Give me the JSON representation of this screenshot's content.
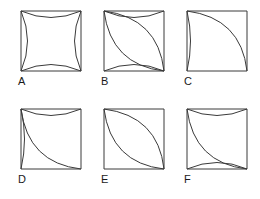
{
  "sheet": {
    "title": "Six square-with-arc geometric figures",
    "background_color": "#ffffff",
    "stroke_color": "#3a3a3a",
    "label_color": "#1a1a1a",
    "width": 260,
    "height": 199,
    "columns": 3,
    "rows": 2
  },
  "figures": [
    {
      "id": "A",
      "label": "A",
      "description": "Square with all four sides replaced by arcs curving inward (concave square / astroid)",
      "x": 20,
      "y": 10,
      "size": 62,
      "label_x": 18,
      "label_y": 80,
      "arcs": [
        {
          "name": "top-inward-arc",
          "from": "top-left",
          "to": "top-right",
          "bulge": "inward"
        },
        {
          "name": "right-inward-arc",
          "from": "top-right",
          "to": "bottom-right",
          "bulge": "inward"
        },
        {
          "name": "bottom-inward-arc",
          "from": "bottom-left",
          "to": "bottom-right",
          "bulge": "inward"
        },
        {
          "name": "left-inward-arc",
          "from": "top-left",
          "to": "bottom-left",
          "bulge": "inward"
        }
      ]
    },
    {
      "id": "B",
      "label": "B",
      "description": "Square with top and bottom arcs curving inward, plus a lens (two arcs) spanning the top-left to bottom-right diagonal",
      "x": 103,
      "y": 10,
      "size": 62,
      "label_x": 101,
      "label_y": 80,
      "arcs": [
        {
          "name": "top-inward-arc",
          "from": "top-left",
          "to": "top-right",
          "bulge": "inward"
        },
        {
          "name": "bottom-inward-arc",
          "from": "bottom-left",
          "to": "bottom-right",
          "bulge": "inward"
        },
        {
          "name": "diagonal-arc-upper",
          "from": "top-left",
          "to": "bottom-right",
          "bulge": "toward-top-right"
        },
        {
          "name": "diagonal-arc-lower",
          "from": "top-left",
          "to": "bottom-right",
          "bulge": "toward-bottom-left"
        }
      ]
    },
    {
      "id": "C",
      "label": "C",
      "description": "Square with left side arc bulging outward slightly and one quarter-circle arc from top-left to bottom-right",
      "x": 186,
      "y": 10,
      "size": 62,
      "label_x": 184,
      "label_y": 80,
      "arcs": [
        {
          "name": "left-outward-arc",
          "from": "top-left",
          "to": "bottom-left",
          "bulge": "outward"
        },
        {
          "name": "diagonal-arc-upper",
          "from": "top-left",
          "to": "bottom-right",
          "bulge": "toward-top-right"
        }
      ]
    },
    {
      "id": "D",
      "label": "D",
      "description": "Square with top arc curving inward, left arc bulging outward, plus an arc from top-left to bottom-right bowed toward the lower-left",
      "x": 20,
      "y": 108,
      "size": 62,
      "label_x": 18,
      "label_y": 178,
      "arcs": [
        {
          "name": "top-inward-arc",
          "from": "top-left",
          "to": "top-right",
          "bulge": "inward"
        },
        {
          "name": "left-outward-arc",
          "from": "top-left",
          "to": "bottom-left",
          "bulge": "outward"
        },
        {
          "name": "diagonal-arc-lower",
          "from": "top-left",
          "to": "bottom-right",
          "bulge": "toward-bottom-left"
        }
      ]
    },
    {
      "id": "E",
      "label": "E",
      "description": "Plain square with a lens (two opposing arcs) spanning the top-left to bottom-right diagonal",
      "x": 103,
      "y": 108,
      "size": 62,
      "label_x": 101,
      "label_y": 178,
      "arcs": [
        {
          "name": "diagonal-arc-upper",
          "from": "top-left",
          "to": "bottom-right",
          "bulge": "toward-top-right"
        },
        {
          "name": "diagonal-arc-lower",
          "from": "top-left",
          "to": "bottom-right",
          "bulge": "toward-bottom-left"
        }
      ]
    },
    {
      "id": "F",
      "label": "F",
      "description": "Square with top and bottom arcs curving inward plus one arc from top-left to bottom-right bowed toward the lower-left",
      "x": 186,
      "y": 108,
      "size": 62,
      "label_x": 184,
      "label_y": 178,
      "arcs": [
        {
          "name": "top-inward-arc",
          "from": "top-left",
          "to": "top-right",
          "bulge": "inward"
        },
        {
          "name": "bottom-inward-arc",
          "from": "bottom-left",
          "to": "bottom-right",
          "bulge": "inward"
        },
        {
          "name": "diagonal-arc-lower",
          "from": "top-left",
          "to": "bottom-right",
          "bulge": "toward-bottom-left"
        }
      ]
    }
  ]
}
